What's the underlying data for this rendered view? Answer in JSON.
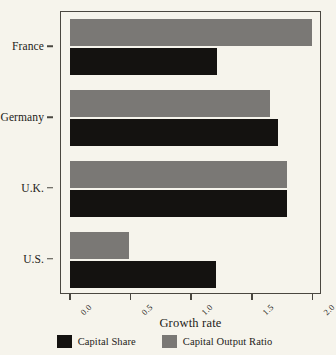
{
  "chart_data": {
    "type": "bar",
    "orientation": "horizontal",
    "title": "",
    "xlabel": "Growth rate",
    "ylabel": "",
    "categories": [
      "France",
      "Germany",
      "U.K.",
      "U.S."
    ],
    "series": [
      {
        "name": "Capital Share",
        "color": "#141210",
        "values": [
          1.21,
          1.71,
          1.79,
          1.2
        ]
      },
      {
        "name": "Capital Output Ratio",
        "color": "#7a7875",
        "values": [
          1.99,
          1.65,
          1.79,
          0.49
        ]
      }
    ],
    "xlim": [
      0.0,
      2.06
    ],
    "xticks": [
      0.0,
      0.5,
      1.0,
      1.5,
      2.0
    ],
    "xtick_labels": [
      "0.0",
      "0.5",
      "1.0",
      "1.5",
      "2.0"
    ],
    "grid": false,
    "legend_position": "bottom",
    "background_color": "#f6f4ec",
    "frame_color": "#4a4740"
  }
}
